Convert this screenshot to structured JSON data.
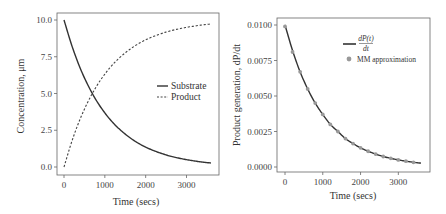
{
  "chart_data": [
    {
      "type": "line",
      "title": "",
      "xlabel": "Time (secs)",
      "ylabel": "Concentration, μm",
      "xlim": [
        0,
        3600
      ],
      "ylim": [
        0,
        10
      ],
      "x_ticks": [
        "0",
        "1000",
        "2000",
        "3000"
      ],
      "y_ticks": [
        "0.0",
        "2.5",
        "5.0",
        "7.5",
        "10.0"
      ],
      "grid": false,
      "legend_position": "center right",
      "x": [
        0,
        200,
        400,
        600,
        800,
        1000,
        1200,
        1400,
        1600,
        1800,
        2000,
        2200,
        2400,
        2600,
        2800,
        3000,
        3200,
        3400,
        3600
      ],
      "series": [
        {
          "name": "Substrate",
          "style": "solid",
          "values": [
            10.0,
            8.19,
            6.7,
            5.49,
            4.49,
            3.68,
            3.01,
            2.47,
            2.02,
            1.65,
            1.35,
            1.11,
            0.91,
            0.74,
            0.61,
            0.5,
            0.41,
            0.33,
            0.27
          ]
        },
        {
          "name": "Product",
          "style": "dashed",
          "values": [
            0.0,
            1.81,
            3.3,
            4.51,
            5.51,
            6.32,
            6.99,
            7.53,
            7.98,
            8.35,
            8.65,
            8.89,
            9.09,
            9.26,
            9.39,
            9.5,
            9.59,
            9.67,
            9.73
          ]
        }
      ]
    },
    {
      "type": "line",
      "title": "",
      "xlabel": "Time (secs)",
      "ylabel": "Product generation, dP/dt",
      "xlim": [
        0,
        3600
      ],
      "ylim": [
        0,
        0.01
      ],
      "x_ticks": [
        "0",
        "1000",
        "2000",
        "3000"
      ],
      "y_ticks": [
        "0.0000",
        "0.0025",
        "0.0050",
        "0.0075",
        "0.0100"
      ],
      "grid": false,
      "legend_position": "upper right",
      "x": [
        0,
        200,
        400,
        600,
        800,
        1000,
        1200,
        1400,
        1600,
        1800,
        2000,
        2200,
        2400,
        2600,
        2800,
        3000,
        3200,
        3400,
        3600
      ],
      "series": [
        {
          "name": "dP(t)/dt",
          "style": "solid",
          "values": [
            0.01,
            0.0082,
            0.0067,
            0.0055,
            0.0045,
            0.0037,
            0.003,
            0.0025,
            0.002,
            0.00165,
            0.00135,
            0.00111,
            0.00091,
            0.00074,
            0.00061,
            0.0005,
            0.00041,
            0.00033,
            0.00027
          ]
        },
        {
          "name": "MM approximation",
          "style": "markers",
          "x": [
            0,
            200,
            400,
            600,
            800,
            1000,
            1200,
            1400,
            1600,
            1800,
            2000,
            2200,
            2400,
            2600,
            2800,
            3000,
            3200,
            3400
          ],
          "values": [
            0.0099,
            0.0081,
            0.0067,
            0.0055,
            0.0045,
            0.0037,
            0.003,
            0.0025,
            0.002,
            0.00165,
            0.00135,
            0.00111,
            0.00091,
            0.00074,
            0.00061,
            0.0005,
            0.00041,
            0.00033
          ]
        }
      ]
    }
  ],
  "left": {
    "xlabel": "Time (secs)",
    "ylabel": "Concentration, μm",
    "x_ticks": [
      "0",
      "1000",
      "2000",
      "3000"
    ],
    "y_ticks": [
      "0.0",
      "2.5",
      "5.0",
      "7.5",
      "10.0"
    ],
    "legend": {
      "substrate": "Substrate",
      "product": "Product"
    }
  },
  "right": {
    "xlabel": "Time (secs)",
    "ylabel": "Product generation, dP/dt",
    "x_ticks": [
      "0",
      "1000",
      "2000",
      "3000"
    ],
    "y_ticks": [
      "0.0000",
      "0.0025",
      "0.0050",
      "0.0075",
      "0.0100"
    ],
    "legend": {
      "deriv_num": "dP(t)",
      "deriv_den": "dt",
      "mm": "MM approximation"
    }
  },
  "colors": {
    "line": "#333333",
    "marker": "#999999",
    "axis": "#555555"
  }
}
